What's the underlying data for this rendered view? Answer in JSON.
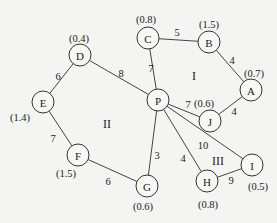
{
  "graph": {
    "node_radius": 11,
    "nodes": [
      {
        "id": "A",
        "label": "A",
        "x": 251,
        "y": 90,
        "value": "(0.7)",
        "vx": 254,
        "vy": 73
      },
      {
        "id": "B",
        "label": "B",
        "x": 209,
        "y": 42,
        "value": "(1.5)",
        "vx": 209,
        "vy": 24
      },
      {
        "id": "C",
        "label": "C",
        "x": 148,
        "y": 38,
        "value": "(0.8)",
        "vx": 146,
        "vy": 19
      },
      {
        "id": "D",
        "label": "D",
        "x": 80,
        "y": 55,
        "value": "(0.4)",
        "vx": 79,
        "vy": 38
      },
      {
        "id": "E",
        "label": "E",
        "x": 43,
        "y": 102,
        "value": "(1.4)",
        "vx": 20,
        "vy": 117
      },
      {
        "id": "F",
        "label": "F",
        "x": 78,
        "y": 155,
        "value": "(1.5)",
        "vx": 66,
        "vy": 173
      },
      {
        "id": "G",
        "label": "G",
        "x": 147,
        "y": 186,
        "value": "(0.6)",
        "vx": 143,
        "vy": 206
      },
      {
        "id": "H",
        "label": "H",
        "x": 207,
        "y": 181,
        "value": "(0.8)",
        "vx": 208,
        "vy": 204
      },
      {
        "id": "I",
        "label": "I",
        "x": 252,
        "y": 165,
        "value": "(0.5)",
        "vx": 258,
        "vy": 186
      },
      {
        "id": "J",
        "label": "J",
        "x": 210,
        "y": 121,
        "value": "(0.6)",
        "vx": 204,
        "vy": 103
      },
      {
        "id": "P",
        "label": "P",
        "x": 158,
        "y": 100,
        "value": "",
        "vx": 0,
        "vy": 0
      }
    ],
    "edges": [
      {
        "from": "C",
        "to": "B",
        "weight": "5",
        "lx": 177,
        "ly": 32
      },
      {
        "from": "B",
        "to": "A",
        "weight": "4",
        "lx": 232,
        "ly": 60
      },
      {
        "from": "A",
        "to": "J",
        "weight": "4",
        "lx": 234,
        "ly": 111
      },
      {
        "from": "C",
        "to": "P",
        "weight": "7",
        "lx": 151,
        "ly": 68
      },
      {
        "from": "D",
        "to": "P",
        "weight": "8",
        "lx": 121,
        "ly": 73
      },
      {
        "from": "D",
        "to": "E",
        "weight": "6",
        "lx": 58,
        "ly": 76
      },
      {
        "from": "E",
        "to": "F",
        "weight": "7",
        "lx": 53,
        "ly": 138
      },
      {
        "from": "F",
        "to": "G",
        "weight": "6",
        "lx": 108,
        "ly": 181
      },
      {
        "from": "P",
        "to": "J",
        "weight": "7",
        "lx": 188,
        "ly": 104
      },
      {
        "from": "P",
        "to": "G",
        "weight": "3",
        "lx": 157,
        "ly": 155
      },
      {
        "from": "P",
        "to": "H",
        "weight": "4",
        "lx": 183,
        "ly": 158
      },
      {
        "from": "P",
        "to": "I",
        "weight": "10",
        "lx": 203,
        "ly": 145
      },
      {
        "from": "H",
        "to": "I",
        "weight": "9",
        "lx": 231,
        "ly": 180
      }
    ],
    "regions": [
      {
        "label": "I",
        "x": 194,
        "y": 76
      },
      {
        "label": "II",
        "x": 107,
        "y": 124
      },
      {
        "label": "III",
        "x": 218,
        "y": 161
      }
    ]
  }
}
